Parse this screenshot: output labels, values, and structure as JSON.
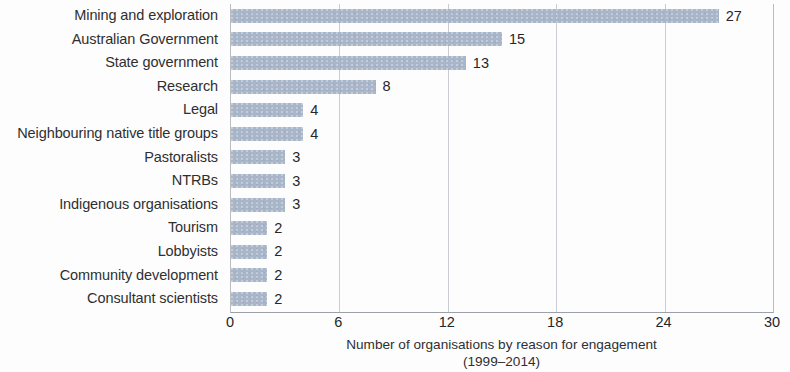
{
  "chart_data": {
    "type": "bar",
    "orientation": "horizontal",
    "title": "",
    "subtitle": "",
    "xlabel_line1": "Number of organisations by reason for engagement",
    "xlabel_line2": "(1999–2014)",
    "ylabel": "",
    "categories": [
      "Mining and exploration",
      "Australian Government",
      "State government",
      "Research",
      "Legal",
      "Neighbouring native title groups",
      "Pastoralists",
      "NTRBs",
      "Indigenous organisations",
      "Tourism",
      "Lobbyists",
      "Community development",
      "Consultant scientists"
    ],
    "values": [
      27,
      15,
      13,
      8,
      4,
      4,
      3,
      3,
      3,
      2,
      2,
      2,
      2
    ],
    "value_labels": [
      "27",
      "15",
      "13",
      "8",
      "4",
      "4",
      "3",
      "3",
      "3",
      "2",
      "2",
      "2",
      "2"
    ],
    "xlim": [
      0,
      30
    ],
    "xticks": [
      0,
      6,
      12,
      18,
      24,
      30
    ],
    "xtick_labels": [
      "0",
      "6",
      "12",
      "18",
      "24",
      "30"
    ],
    "gridlines": [
      6,
      12,
      18,
      24
    ],
    "grid": true,
    "legend": "none",
    "bar_color": "#a9b6c9",
    "gridline_color": "#c9ccd1",
    "axis_color": "#9da1a7",
    "text_color": "#2f2f31"
  }
}
